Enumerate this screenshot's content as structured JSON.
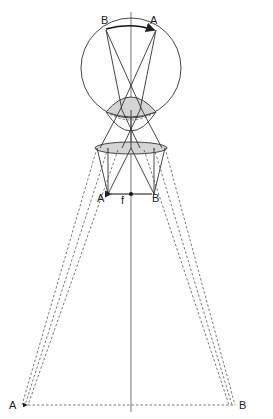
{
  "diagram": {
    "type": "optics-ray-diagram",
    "labels": {
      "retina_left": "B",
      "retina_right": "A",
      "object_left": "A",
      "focal_point": "f",
      "object_right": "B",
      "virtual_left": "A",
      "virtual_right": "B"
    },
    "colors": {
      "line": "#333333",
      "dashed": "#555555",
      "fill": "#d4d4d4",
      "background": "#ffffff"
    }
  }
}
